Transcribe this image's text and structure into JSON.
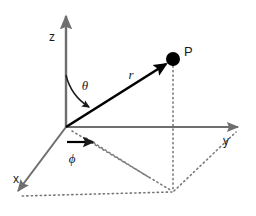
{
  "figure": {
    "background_color": "#ffffff",
    "width": 256,
    "height": 216
  },
  "colors": {
    "axis": "#6e6e6e",
    "vector": "#000000",
    "dotted": "#7a7a7a",
    "text": "#1a1a1a",
    "point": "#000000",
    "background": "#ffffff"
  },
  "origin": {
    "x": 66,
    "y": 127
  },
  "axes": [
    {
      "name": "z-axis",
      "label": "z",
      "label_x": 52,
      "label_y": 41,
      "x1": 66,
      "y1": 127,
      "x2": 66,
      "y2": 12,
      "style": "solid",
      "arrow": true
    },
    {
      "name": "y-axis",
      "label": "y",
      "label_x": 226,
      "label_y": 145,
      "x1": 66,
      "y1": 127,
      "x2": 243,
      "y2": 127,
      "style": "solid",
      "arrow": true
    },
    {
      "name": "x-axis",
      "label": "x",
      "label_x": 16,
      "label_y": 183,
      "x1": 66,
      "y1": 127,
      "x2": 13,
      "y2": 198,
      "style": "solid",
      "arrow": true
    }
  ],
  "vector": {
    "name": "r-vector",
    "label": "r",
    "label_x": 131,
    "label_y": 79,
    "x1": 66,
    "y1": 127,
    "x2": 171,
    "y2": 61,
    "style": "solid",
    "arrow": true
  },
  "point": {
    "label": "P",
    "x": 173,
    "y": 59,
    "radius": 7,
    "label_x": 184,
    "label_y": 56
  },
  "angles": [
    {
      "name": "theta",
      "symbol": "θ",
      "label_x": 85,
      "label_y": 90,
      "description": "polar angle from z-axis to r"
    },
    {
      "name": "phi",
      "symbol": "ϕ",
      "label_x": 72,
      "label_y": 163,
      "description": "azimuthal angle from x-axis to projection of r in xy-plane"
    }
  ],
  "projection_lines": [
    {
      "name": "p-to-xy-dropline",
      "x1": 173,
      "y1": 62,
      "x2": 173,
      "y2": 192
    },
    {
      "name": "xy-projection-to-origin",
      "x1": 66,
      "y1": 127,
      "x2": 173,
      "y2": 192
    },
    {
      "name": "xy-projection-to-x-axis",
      "x1": 173,
      "y1": 192,
      "x2": 20,
      "y2": 196
    },
    {
      "name": "xy-projection-to-y-axis",
      "x1": 173,
      "y1": 192,
      "x2": 236,
      "y2": 132
    }
  ],
  "phi_arrow": {
    "name": "phi-direction-arrow",
    "x1": 67,
    "y1": 142,
    "x2": 98,
    "y2": 142
  }
}
